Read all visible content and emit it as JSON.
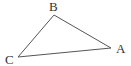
{
  "diagram": {
    "type": "triangle",
    "stroke_color": "#555555",
    "vertices": [
      {
        "label": "A",
        "x": 111,
        "y": 48,
        "label_x": 116,
        "label_y": 53
      },
      {
        "label": "B",
        "x": 54,
        "y": 15,
        "label_x": 49,
        "label_y": 11
      },
      {
        "label": "C",
        "x": 18,
        "y": 57,
        "label_x": 5,
        "label_y": 64
      }
    ]
  }
}
